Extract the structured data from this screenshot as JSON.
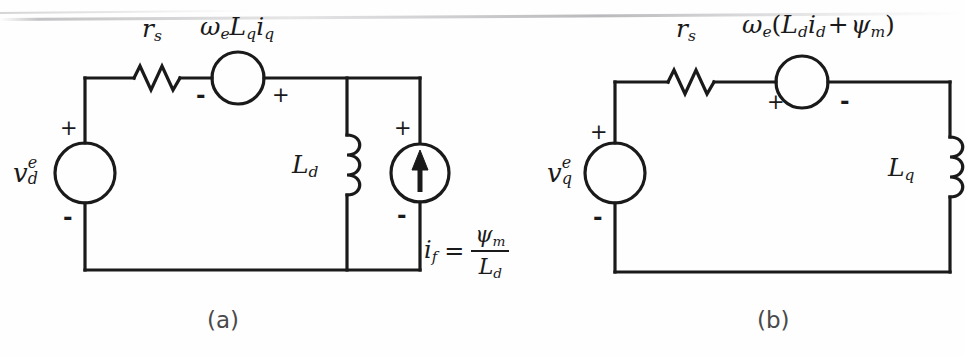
{
  "figure": {
    "background_color": "#fefefe",
    "line_color": "#1a1a1a",
    "width": 965,
    "height": 357
  },
  "panel_a": {
    "caption": "(a)",
    "source_label": {
      "base": "v",
      "sup": "e",
      "sub": "d"
    },
    "source_plus": "+",
    "source_minus": "-",
    "resistor_label": {
      "base": "r",
      "sub": "s"
    },
    "dependent_source_label": {
      "text": "ωeLqiq",
      "omega": "ω",
      "omega_sub": "e",
      "L": "L",
      "L_sub": "q",
      "i": "i",
      "i_sub": "q"
    },
    "dependent_source_left_sign": "-",
    "dependent_source_right_sign": "+",
    "inductor_label": {
      "base": "L",
      "sub": "d"
    },
    "current_source_plus": "+",
    "current_source_minus": "-",
    "current_source_arrow": "up-arrow",
    "equation": {
      "lhs_base": "i",
      "lhs_sub": "f",
      "equals": "=",
      "numerator_base": "ψ",
      "numerator_sub": "m",
      "denominator_base": "L",
      "denominator_sub": "d"
    }
  },
  "panel_b": {
    "caption": "(b)",
    "source_label": {
      "base": "v",
      "sup": "e",
      "sub": "q"
    },
    "source_plus": "+",
    "source_minus": "-",
    "resistor_label": {
      "base": "r",
      "sub": "s"
    },
    "dependent_source_label": {
      "omega": "ω",
      "omega_sub": "e",
      "open_paren": "(",
      "L": "L",
      "L_sub": "d",
      "i": "i",
      "i_sub": "d",
      "plus": "+",
      "psi": "ψ",
      "psi_sub": "m",
      "close_paren": ")"
    },
    "dependent_source_left_sign": "+",
    "dependent_source_right_sign": "-",
    "inductor_label": {
      "base": "L",
      "sub": "q"
    }
  }
}
